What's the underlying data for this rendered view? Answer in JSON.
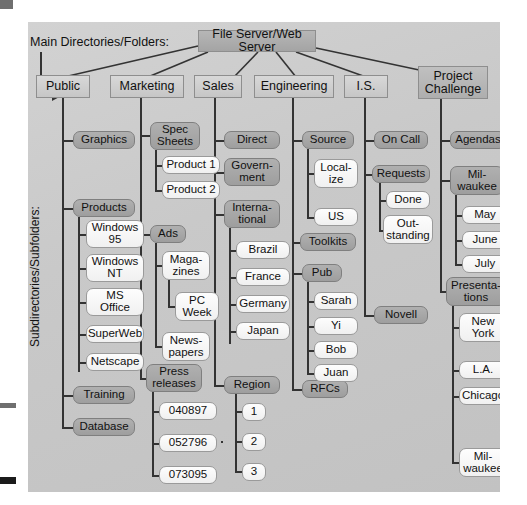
{
  "labels": {
    "main_directories": "Main Directories/Folders:",
    "subdirectories": "Subdirectories/Subfolders:"
  },
  "root": {
    "label": "File Server/Web Server"
  },
  "columns": [
    {
      "key": "public",
      "label": "Public",
      "children": [
        {
          "label": "Graphics",
          "children": []
        },
        {
          "label": "Products",
          "children": [
            {
              "label": "Windows 95"
            },
            {
              "label": "Windows NT"
            },
            {
              "label": "MS Office"
            },
            {
              "label": "SuperWeb"
            },
            {
              "label": "Netscape"
            }
          ]
        },
        {
          "label": "Training",
          "children": []
        },
        {
          "label": "Database",
          "children": []
        }
      ]
    },
    {
      "key": "marketing",
      "label": "Marketing",
      "children": [
        {
          "label": "Spec Sheets",
          "children": [
            {
              "label": "Product 1"
            },
            {
              "label": "Product 2"
            }
          ]
        },
        {
          "label": "Ads",
          "children": [
            {
              "label": "Maga-zines",
              "children": [
                {
                  "label": "PC Week"
                }
              ]
            },
            {
              "label": "News-papers"
            }
          ]
        },
        {
          "label": "Press releases",
          "children": [
            {
              "label": "040897"
            },
            {
              "label": "052796"
            },
            {
              "label": "073095"
            }
          ]
        }
      ]
    },
    {
      "key": "sales",
      "label": "Sales",
      "children": [
        {
          "label": "Direct",
          "children": []
        },
        {
          "label": "Govern-ment",
          "children": []
        },
        {
          "label": "Interna-tional",
          "children": [
            {
              "label": "Brazil"
            },
            {
              "label": "France"
            },
            {
              "label": "Germany"
            },
            {
              "label": "Japan"
            }
          ]
        },
        {
          "label": "Region",
          "children": [
            {
              "label": "1"
            },
            {
              "label": "2"
            },
            {
              "label": "3"
            }
          ]
        }
      ]
    },
    {
      "key": "engineering",
      "label": "Engineering",
      "children": [
        {
          "label": "Source",
          "children": [
            {
              "label": "Local-ize"
            },
            {
              "label": "US"
            }
          ]
        },
        {
          "label": "Toolkits",
          "children": []
        },
        {
          "label": "Pub",
          "children": [
            {
              "label": "Sarah"
            },
            {
              "label": "Yi"
            },
            {
              "label": "Bob"
            },
            {
              "label": "Juan"
            }
          ]
        },
        {
          "label": "RFCs",
          "children": []
        }
      ]
    },
    {
      "key": "is",
      "label": "I.S.",
      "children": [
        {
          "label": "On Call",
          "children": []
        },
        {
          "label": "Requests",
          "children": [
            {
              "label": "Done"
            },
            {
              "label": "Out-standing"
            }
          ]
        },
        {
          "label": "Novell",
          "children": []
        }
      ]
    },
    {
      "key": "project_challenge",
      "label": "Project Challenge",
      "children": [
        {
          "label": "Agendas",
          "children": []
        },
        {
          "label": "Mil-waukee",
          "children": [
            {
              "label": "May"
            },
            {
              "label": "June"
            },
            {
              "label": "July"
            }
          ]
        },
        {
          "label": "Presenta-tions",
          "children": [
            {
              "label": "New York"
            },
            {
              "label": "L.A."
            },
            {
              "label": "Chicago"
            },
            {
              "label": "Mil-waukee"
            }
          ]
        }
      ]
    }
  ],
  "nodes": {
    "public": "Public",
    "marketing": "Marketing",
    "sales": "Sales",
    "engineering": "Engineering",
    "is": "I.S.",
    "project": "Project<br>Challenge",
    "graphics": "Graphics",
    "products": "Products",
    "win95": "Windows<br>95",
    "winnt": "Windows<br>NT",
    "msoffice": "MS<br>Office",
    "superweb": "SuperWeb",
    "netscape": "Netscape",
    "training": "Training",
    "database": "Database",
    "specsheets": "Spec<br>Sheets",
    "product1": "Product 1",
    "product2": "Product 2",
    "ads": "Ads",
    "magazines": "Maga-<br>zines",
    "pcweek": "PC<br>Week",
    "newspapers": "News-<br>papers",
    "pressreleases": "Press<br>releases",
    "pr1": "040897",
    "pr2": "052796",
    "pr3": "073095",
    "direct": "Direct",
    "government": "Govern-<br>ment",
    "international": "Interna-<br>tional",
    "brazil": "Brazil",
    "france": "France",
    "germany": "Germany",
    "japan": "Japan",
    "region": "Region",
    "r1": "1",
    "r2": "2",
    "r3": "3",
    "source": "Source",
    "localize": "Local-<br>ize",
    "us": "US",
    "toolkits": "Toolkits",
    "pub": "Pub",
    "sarah": "Sarah",
    "yi": "Yi",
    "bob": "Bob",
    "juan": "Juan",
    "rfcs": "RFCs",
    "oncall": "On Call",
    "requests": "Requests",
    "done": "Done",
    "outstanding": "Out-<br>standing",
    "novell": "Novell",
    "agendas": "Agendas",
    "milwaukee": "Mil-<br>waukee",
    "may": "May",
    "june": "June",
    "july": "July",
    "presentations": "Presenta-<br>tions",
    "newyork": "New<br>York",
    "la": "L.A.",
    "chicago": "Chicago",
    "milwaukee2": "Mil-<br>waukee",
    "rootbox": "File Server/Web Server"
  },
  "colors": {
    "panel_bg": "#c9c9c9",
    "level1_box": "#ababab",
    "level2_box": "#cfcfcf",
    "level3_box": "#a7a7a7",
    "leaf_box": "#f7f7f7",
    "line": "#333333"
  }
}
